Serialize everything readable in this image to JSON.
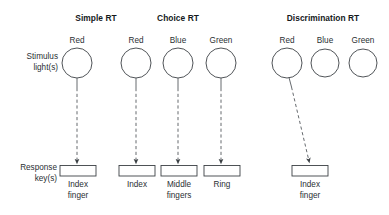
{
  "figure": {
    "background_color": "#ffffff",
    "line_color": "#55595d",
    "text_color": "#2a2f33"
  },
  "row_labels": {
    "stimulus_line1": "Stimulus",
    "stimulus_line2": "light(s)",
    "response_line1": "Response",
    "response_line2": "key(s)"
  },
  "columns": [
    {
      "title": "Simple RT",
      "lights": [
        {
          "label": "Red",
          "connected": true
        }
      ],
      "keys": [
        {
          "line1": "Index",
          "line2": "finger"
        }
      ]
    },
    {
      "title": "Choice RT",
      "lights": [
        {
          "label": "Red",
          "connected": true
        },
        {
          "label": "Blue",
          "connected": true
        },
        {
          "label": "Green",
          "connected": true
        }
      ],
      "keys": [
        {
          "line1": "Index",
          "line2": ""
        },
        {
          "line1": "Middle",
          "line2": "fingers"
        },
        {
          "line1": "Ring",
          "line2": ""
        }
      ]
    },
    {
      "title": "Discrimination RT",
      "lights": [
        {
          "label": "Red",
          "connected": true
        },
        {
          "label": "Blue",
          "connected": false
        },
        {
          "label": "Green",
          "connected": false
        }
      ],
      "keys": [
        {
          "line1": "Index",
          "line2": "finger"
        }
      ]
    }
  ]
}
